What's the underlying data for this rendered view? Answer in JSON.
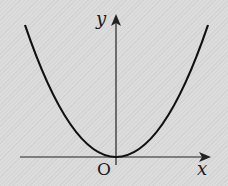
{
  "diagram": {
    "type": "function-graph",
    "labels": {
      "y_axis": "y",
      "x_axis": "x",
      "origin": "O"
    },
    "colors": {
      "background": "#d9d9d9",
      "curve": "#111111",
      "axes": "#222222"
    }
  }
}
